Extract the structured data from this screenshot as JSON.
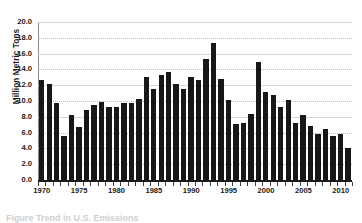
{
  "chart_data": {
    "type": "bar",
    "title": "",
    "xlabel": "",
    "ylabel": "Million Metric Tons",
    "ylim": [
      0.0,
      20.0
    ],
    "ytick_step": 2.0,
    "ytick_labels": [
      "0.0",
      "2.0",
      "4.0",
      "6.0",
      "8.0",
      "10.0",
      "12.0",
      "14.0",
      "16.0",
      "18.0",
      "20.0"
    ],
    "ytick_values": [
      0.0,
      2.0,
      4.0,
      6.0,
      8.0,
      10.0,
      12.0,
      14.0,
      16.0,
      18.0,
      20.0
    ],
    "xlim": [
      1969.5,
      2011.5
    ],
    "xtick_labels": [
      "1970",
      "1975",
      "1980",
      "1985",
      "1990",
      "1995",
      "2000",
      "2005",
      "2010"
    ],
    "xtick_values": [
      1970,
      1975,
      1980,
      1985,
      1990,
      1995,
      2000,
      2005,
      2010
    ],
    "grid": "horizontal-dotted",
    "legend": "none",
    "bar_color": "#171717",
    "categories": [
      "1970",
      "1971",
      "1972",
      "1973",
      "1974",
      "1975",
      "1976",
      "1977",
      "1978",
      "1979",
      "1980",
      "1981",
      "1982",
      "1983",
      "1984",
      "1985",
      "1986",
      "1987",
      "1988",
      "1989",
      "1990",
      "1991",
      "1992",
      "1993",
      "1994",
      "1995",
      "1996",
      "1997",
      "1998",
      "1999",
      "2000",
      "2001",
      "2002",
      "2003",
      "2004",
      "2005",
      "2006",
      "2007",
      "2008",
      "2009",
      "2010",
      "2011"
    ],
    "values": [
      12.7,
      12.2,
      9.8,
      5.6,
      8.2,
      6.7,
      8.8,
      9.5,
      9.9,
      9.2,
      9.3,
      9.7,
      9.7,
      10.3,
      13.0,
      11.5,
      13.3,
      13.7,
      12.2,
      11.5,
      13.1,
      12.6,
      15.3,
      17.3,
      12.8,
      10.1,
      7.1,
      7.2,
      8.3,
      15.0,
      11.2,
      10.8,
      9.3,
      10.1,
      7.2,
      8.2,
      6.9,
      5.8,
      6.4,
      5.6,
      5.8,
      4.0
    ],
    "notes": {
      "max_value": 17.3,
      "max_category": "1993",
      "min_value": 4.0,
      "min_category": "2011"
    }
  },
  "caption": {
    "text": "Figure    Trend in U.S. Emissions"
  }
}
